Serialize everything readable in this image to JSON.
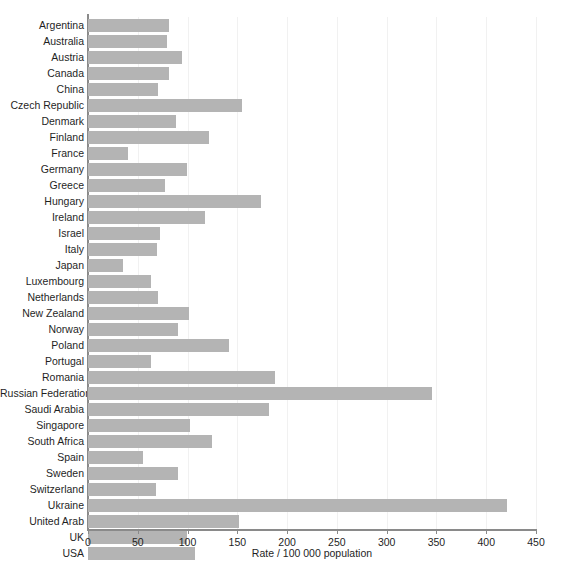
{
  "chart_data": {
    "type": "bar",
    "orientation": "horizontal",
    "title": "",
    "subtitle": "",
    "xlabel": "Rate / 100 000 population",
    "ylabel": "",
    "xlim": [
      0,
      450
    ],
    "ylim": null,
    "xticks": [
      0,
      50,
      100,
      150,
      200,
      250,
      300,
      350,
      400,
      450
    ],
    "grid": "vertical-faint",
    "legend": null,
    "bar_color": "#b4b4b4",
    "axis_color": "#8a8a8a",
    "categories": [
      "Argentina",
      "Australia",
      "Austria",
      "Canada",
      "China",
      "Czech Republic",
      "Denmark",
      "Finland",
      "France",
      "Germany",
      "Greece",
      "Hungary",
      "Ireland",
      "Israel",
      "Italy",
      "Japan",
      "Luxembourg",
      "Netherlands",
      "New Zealand",
      "Norway",
      "Poland",
      "Portugal",
      "Romania",
      "Russian Federation",
      "Saudi Arabia",
      "Singapore",
      "South Africa",
      "Spain",
      "Sweden",
      "Switzerland",
      "Ukraine",
      "United Arab",
      "UK",
      "USA"
    ],
    "values": [
      81,
      79,
      94,
      81,
      70,
      155,
      88,
      122,
      40,
      99,
      77,
      174,
      118,
      72,
      69,
      35,
      63,
      70,
      101,
      90,
      142,
      63,
      188,
      346,
      182,
      102,
      125,
      55,
      90,
      68,
      421,
      152,
      99,
      107
    ]
  }
}
